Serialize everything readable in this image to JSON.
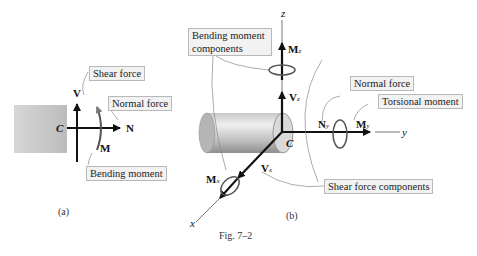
{
  "figure": {
    "caption": "Fig. 7–2",
    "panel_a": {
      "label": "(a)",
      "point": "C",
      "shear_symbol": "V",
      "normal_symbol": "N",
      "moment_symbol": "M",
      "callouts": {
        "shear": "Shear force",
        "normal": "Normal force",
        "bending": "Bending moment"
      }
    },
    "panel_b": {
      "label": "(b)",
      "point": "C",
      "axes": {
        "x": "x",
        "y": "y",
        "z": "z"
      },
      "symbols": {
        "Mz": "M",
        "Mz_sub": "z",
        "Vz": "V",
        "Vz_sub": "z",
        "Ny": "N",
        "Ny_sub": "y",
        "My": "M",
        "My_sub": "y",
        "Mx": "M",
        "Mx_sub": "x",
        "Vx": "V",
        "Vx_sub": "x"
      },
      "callouts": {
        "bending_components": "Bending moment components",
        "normal": "Normal force",
        "torsional": "Torsional moment",
        "shear_components": "Shear force components"
      }
    }
  }
}
